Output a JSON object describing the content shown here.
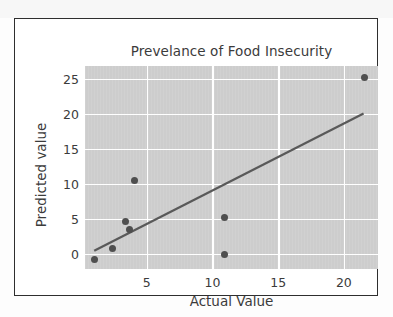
{
  "chart_data": {
    "type": "scatter",
    "title": "Prevelance of Food Insecurity",
    "xlabel": "Actual Value",
    "ylabel": "Predicted value",
    "xlim": [
      0.3,
      22.6
    ],
    "ylim": [
      -2.2,
      26.8
    ],
    "xticks": [
      5,
      10,
      15,
      20
    ],
    "xtick_labels": [
      "5",
      "10",
      "15",
      "20"
    ],
    "yticks": [
      0,
      5,
      10,
      15,
      20,
      25
    ],
    "ytick_labels": [
      "0",
      "5",
      "10",
      "15",
      "20",
      "25"
    ],
    "grid": true,
    "legend": "none",
    "plot_background": "#cfcfcf",
    "grid_color": "#ffffff",
    "point_color": "#4f4f4f",
    "line_color": "#595959",
    "text_color": "#3b3b3b",
    "series": [
      {
        "name": "observations",
        "type": "scatter",
        "points": [
          {
            "x": 1.0,
            "y": -0.8
          },
          {
            "x": 2.4,
            "y": 0.8
          },
          {
            "x": 3.4,
            "y": 4.6
          },
          {
            "x": 3.7,
            "y": 3.4
          },
          {
            "x": 4.1,
            "y": 10.4
          },
          {
            "x": 10.9,
            "y": 5.2
          },
          {
            "x": 10.9,
            "y": -0.1
          },
          {
            "x": 21.6,
            "y": 25.1
          }
        ]
      },
      {
        "name": "fit-line",
        "type": "line",
        "points": [
          {
            "x": 1.0,
            "y": 0.4
          },
          {
            "x": 21.5,
            "y": 20.0
          }
        ]
      }
    ]
  }
}
